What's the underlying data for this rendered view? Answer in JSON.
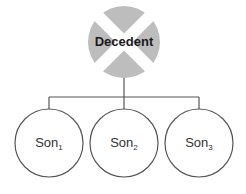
{
  "diagram": {
    "root": {
      "label": "Decedent",
      "marker": "x-mark",
      "fill": "#bdbdbd"
    },
    "children": [
      {
        "base": "Son",
        "sub": "1"
      },
      {
        "base": "Son",
        "sub": "2"
      },
      {
        "base": "Son",
        "sub": "3"
      }
    ],
    "colors": {
      "line": "#555555",
      "circle_fill": "#ffffff",
      "root_fill": "#bdbdbd"
    }
  }
}
